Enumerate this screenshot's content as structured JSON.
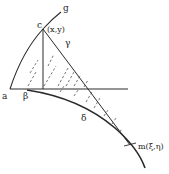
{
  "diagram": {
    "labels": {
      "g": "g",
      "c": "c",
      "xy": "(x,y)",
      "gamma": "γ",
      "a": "a",
      "beta": "β",
      "delta": "δ",
      "m": "m(ξ,η)"
    },
    "colors": {
      "stroke": "#2a2a2a",
      "hatch": "#555555",
      "background": "#ffffff"
    }
  }
}
